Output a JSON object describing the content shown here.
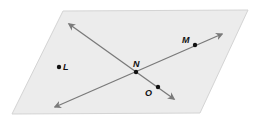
{
  "diagram": {
    "type": "plane-with-intersecting-lines",
    "colors": {
      "plane_fill": "#ececec",
      "plane_edge": "#d4d4d4",
      "line": "#7a7a7a",
      "point": "#111111",
      "label": "#111111"
    },
    "plane": {
      "corners": [
        [
          63,
          11
        ],
        [
          248,
          10
        ],
        [
          200,
          113
        ],
        [
          12,
          114
        ]
      ]
    },
    "lines": [
      {
        "name": "line-NO",
        "from": [
          69,
          24
        ],
        "to": [
          174,
          99
        ]
      },
      {
        "name": "line-MN",
        "from": [
          55,
          107
        ],
        "to": [
          222,
          34
        ]
      }
    ],
    "points": [
      {
        "id": "L",
        "label": "L",
        "x": 59,
        "y": 67,
        "label_x": 63,
        "label_y": 70
      },
      {
        "id": "M",
        "label": "M",
        "x": 195,
        "y": 45,
        "label_x": 182,
        "label_y": 43
      },
      {
        "id": "N",
        "label": "N",
        "x": 136,
        "y": 72,
        "label_x": 133,
        "label_y": 67
      },
      {
        "id": "O",
        "label": "O",
        "x": 158,
        "y": 87,
        "label_x": 145,
        "label_y": 96
      }
    ]
  }
}
